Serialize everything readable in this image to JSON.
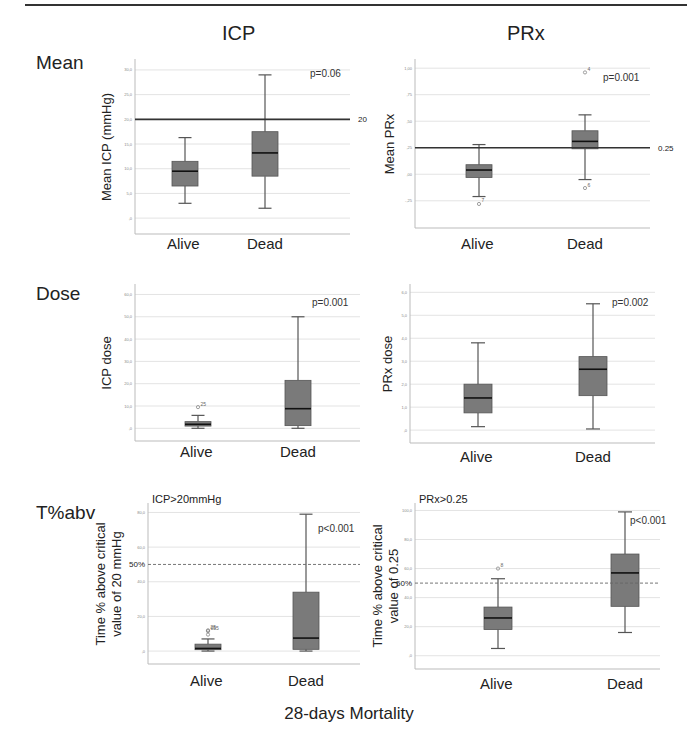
{
  "figure": {
    "column_titles": [
      "ICP",
      "PRx"
    ],
    "row_labels": [
      "Mean",
      "Dose",
      "T%abv"
    ],
    "x_axis_title": "28-days Mortality",
    "categories": [
      "Alive",
      "Dead"
    ]
  },
  "colors": {
    "box_fill": "#7a7a7a",
    "box_edge": "#555555",
    "median": "#111111",
    "gridline": "#e3e3e3",
    "reference_line": "#333333",
    "axis": "#bbbbbb"
  },
  "chart_data": [
    {
      "id": "icp-mean",
      "type": "box",
      "title": "",
      "row": "Mean",
      "column": "ICP",
      "ylabel": "Mean ICP (mmHg)",
      "xlabel": "",
      "categories": [
        "Alive",
        "Dead"
      ],
      "ylim": [
        -2,
        31
      ],
      "yticks": [
        0,
        5,
        10,
        15,
        20,
        25,
        30
      ],
      "ytick_labels": [
        ",0",
        "5,0",
        "10,0",
        "15,0",
        "20,0",
        "25,0",
        "30,0"
      ],
      "grid": true,
      "boxes": [
        {
          "category": "Alive",
          "whisker_low": 3.0,
          "q1": 6.5,
          "median": 9.5,
          "q3": 11.5,
          "whisker_high": 16.3,
          "outliers": []
        },
        {
          "category": "Dead",
          "whisker_low": 2.0,
          "q1": 8.5,
          "median": 13.2,
          "q3": 17.5,
          "whisker_high": 29.0,
          "outliers": []
        }
      ],
      "reference_line": {
        "value": 20,
        "label": "20",
        "style": "solid"
      },
      "annotation": "p=0.06",
      "note": ""
    },
    {
      "id": "prx-mean",
      "type": "box",
      "title": "",
      "row": "Mean",
      "column": "PRx",
      "ylabel": "Mean PRx",
      "xlabel": "",
      "categories": [
        "Alive",
        "Dead"
      ],
      "ylim": [
        -0.45,
        1.03
      ],
      "yticks": [
        -0.25,
        0,
        0.25,
        0.5,
        0.75,
        1.0
      ],
      "ytick_labels": [
        "-,25",
        ",00",
        ",25",
        ",50",
        ",75",
        "1,00"
      ],
      "grid": true,
      "boxes": [
        {
          "category": "Alive",
          "whisker_low": -0.21,
          "q1": -0.03,
          "median": 0.04,
          "q3": 0.09,
          "whisker_high": 0.28,
          "outliers": [
            {
              "value": -0.28,
              "label": "7"
            }
          ]
        },
        {
          "category": "Dead",
          "whisker_low": -0.05,
          "q1": 0.24,
          "median": 0.31,
          "q3": 0.41,
          "whisker_high": 0.56,
          "outliers": [
            {
              "value": -0.13,
              "label": "6"
            },
            {
              "value": 0.96,
              "label": "4"
            }
          ]
        }
      ],
      "reference_line": {
        "value": 0.25,
        "label": "0.25",
        "style": "solid"
      },
      "annotation": "p=0.001",
      "note": ""
    },
    {
      "id": "icp-dose",
      "type": "box",
      "title": "",
      "row": "Dose",
      "column": "ICP",
      "ylabel": "ICP dose",
      "xlabel": "",
      "categories": [
        "Alive",
        "Dead"
      ],
      "ylim": [
        -3,
        62
      ],
      "yticks": [
        0,
        10,
        20,
        30,
        40,
        50,
        60
      ],
      "ytick_labels": [
        ",0",
        "10,0",
        "20,0",
        "30,0",
        "40,0",
        "50,0",
        "60,0"
      ],
      "grid": true,
      "boxes": [
        {
          "category": "Alive",
          "whisker_low": 0.0,
          "q1": 1.0,
          "median": 1.8,
          "q3": 3.0,
          "whisker_high": 5.8,
          "outliers": [
            {
              "value": 9.5,
              "label": "25"
            }
          ]
        },
        {
          "category": "Dead",
          "whisker_low": 0.0,
          "q1": 1.2,
          "median": 8.8,
          "q3": 21.5,
          "whisker_high": 50.0,
          "outliers": []
        }
      ],
      "reference_line": null,
      "annotation": "p=0.001",
      "note": ""
    },
    {
      "id": "prx-dose",
      "type": "box",
      "title": "",
      "row": "Dose",
      "column": "PRx",
      "ylabel": "PRx dose",
      "xlabel": "",
      "categories": [
        "Alive",
        "Dead"
      ],
      "ylim": [
        -0.3,
        6.1
      ],
      "yticks": [
        0,
        1,
        2,
        3,
        4,
        5,
        6
      ],
      "ytick_labels": [
        ",0",
        "1,0",
        "2,0",
        "3,0",
        "4,0",
        "5,0",
        "6,0"
      ],
      "grid": true,
      "boxes": [
        {
          "category": "Alive",
          "whisker_low": 0.15,
          "q1": 0.75,
          "median": 1.4,
          "q3": 2.0,
          "whisker_high": 3.8,
          "outliers": []
        },
        {
          "category": "Dead",
          "whisker_low": 0.05,
          "q1": 1.5,
          "median": 2.65,
          "q3": 3.2,
          "whisker_high": 5.5,
          "outliers": []
        }
      ],
      "reference_line": null,
      "annotation": "p=0.002",
      "note": ""
    },
    {
      "id": "icp-tabv",
      "type": "box",
      "title": "",
      "row": "T%abv",
      "column": "ICP",
      "ylabel": "Time % above critical value of 20 mmHg",
      "xlabel": "",
      "categories": [
        "Alive",
        "Dead"
      ],
      "ylim": [
        -4,
        82
      ],
      "yticks": [
        0,
        20,
        40,
        60,
        80
      ],
      "ytick_labels": [
        ",0",
        "20,0",
        "40,0",
        "60,0",
        "80,0"
      ],
      "grid": true,
      "boxes": [
        {
          "category": "Alive",
          "whisker_low": 0.0,
          "q1": 0.8,
          "median": 1.5,
          "q3": 4.0,
          "whisker_high": 7.0,
          "outliers": [
            {
              "value": 9.5,
              "label": ""
            },
            {
              "value": 12.0,
              "label": "25"
            },
            {
              "value": 11.5,
              "label": "055"
            }
          ]
        },
        {
          "category": "Dead",
          "whisker_low": 0.0,
          "q1": 1.0,
          "median": 7.5,
          "q3": 34.0,
          "whisker_high": 79.0,
          "outliers": []
        }
      ],
      "reference_line": {
        "value": 50,
        "label": "50%",
        "style": "dashed"
      },
      "annotation": "p<0.001",
      "note": "ICP>20mmHg"
    },
    {
      "id": "prx-tabv",
      "type": "box",
      "title": "",
      "row": "T%abv",
      "column": "PRx",
      "ylabel": "Time % above critical value of 0.25",
      "xlabel": "",
      "categories": [
        "Alive",
        "Dead"
      ],
      "ylim": [
        -5,
        101
      ],
      "yticks": [
        0,
        20,
        40,
        60,
        80,
        100
      ],
      "ytick_labels": [
        ",0",
        "20,0",
        "40,0",
        "60,0",
        "80,0",
        "100,0"
      ],
      "grid": true,
      "boxes": [
        {
          "category": "Alive",
          "whisker_low": 5.0,
          "q1": 18.0,
          "median": 26.0,
          "q3": 33.5,
          "whisker_high": 53.0,
          "outliers": [
            {
              "value": 60.0,
              "label": "8"
            }
          ]
        },
        {
          "category": "Dead",
          "whisker_low": 16.0,
          "q1": 34.0,
          "median": 57.0,
          "q3": 70.0,
          "whisker_high": 99.0,
          "outliers": []
        }
      ],
      "reference_line": {
        "value": 50,
        "label": "50%",
        "style": "dashed"
      },
      "annotation": "p<0.001",
      "note": "PRx>0.25"
    }
  ]
}
